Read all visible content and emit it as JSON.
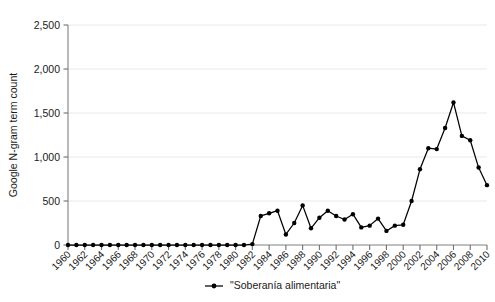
{
  "chart_data": {
    "type": "line",
    "title": "",
    "subtitle": "",
    "xlabel": "",
    "ylabel": "Google N-gram term count",
    "xlim": [
      1960,
      2010
    ],
    "ylim": [
      0,
      2500
    ],
    "ytick_labels": [
      "0",
      "500",
      "1,000",
      "1,500",
      "2,000",
      "2,500"
    ],
    "ytick_values": [
      0,
      500,
      1000,
      1500,
      2000,
      2500
    ],
    "xtick_labels": [
      "1960",
      "1962",
      "1964",
      "1966",
      "1968",
      "1970",
      "1972",
      "1974",
      "1976",
      "1978",
      "1980",
      "1982",
      "1984",
      "1986",
      "1988",
      "1990",
      "1992",
      "1994",
      "1996",
      "1998",
      "2000",
      "2002",
      "2004",
      "2006",
      "2008",
      "2010"
    ],
    "xtick_values": [
      1960,
      1962,
      1964,
      1966,
      1968,
      1970,
      1972,
      1974,
      1976,
      1978,
      1980,
      1982,
      1984,
      1986,
      1988,
      1990,
      1992,
      1994,
      1996,
      1998,
      2000,
      2002,
      2004,
      2006,
      2008,
      2010
    ],
    "grid": "horizontal",
    "legend_position": "bottom-center",
    "marker": "filled-circle",
    "line_color": "#000000",
    "series": [
      {
        "name": "\"Soberanía alimentaria\"",
        "x": [
          1960,
          1961,
          1962,
          1963,
          1964,
          1965,
          1966,
          1967,
          1968,
          1969,
          1970,
          1971,
          1972,
          1973,
          1974,
          1975,
          1976,
          1977,
          1978,
          1979,
          1980,
          1981,
          1982,
          1983,
          1984,
          1985,
          1986,
          1987,
          1988,
          1989,
          1990,
          1991,
          1992,
          1993,
          1994,
          1995,
          1996,
          1997,
          1998,
          1999,
          2000,
          2001,
          2002,
          2003,
          2004,
          2005,
          2006,
          2007,
          2008,
          2009,
          2010
        ],
        "values": [
          0,
          0,
          0,
          0,
          0,
          0,
          0,
          0,
          0,
          0,
          0,
          0,
          0,
          0,
          0,
          0,
          0,
          0,
          0,
          0,
          0,
          0,
          10,
          330,
          360,
          390,
          120,
          250,
          450,
          190,
          310,
          390,
          330,
          290,
          350,
          200,
          220,
          300,
          160,
          220,
          230,
          500,
          860,
          1100,
          1090,
          1330,
          1620,
          1240,
          1190,
          880,
          680
        ]
      }
    ]
  },
  "legend": {
    "entries": [
      {
        "label": "\"Soberanía alimentaria\"",
        "color": "#000000"
      }
    ]
  },
  "axes": {
    "y_title": "Google N-gram term count"
  }
}
